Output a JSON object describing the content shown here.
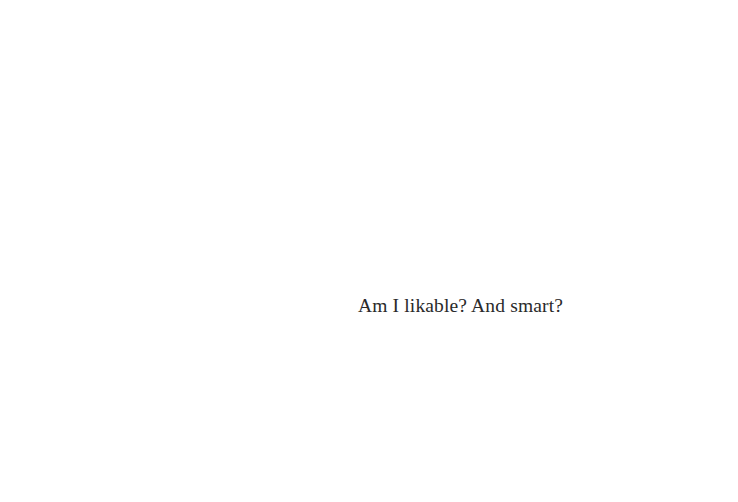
{
  "slide": {
    "caption": "Am I likable? And smart?",
    "background_color": "#ffffff",
    "text_color": "#2a2a2a"
  }
}
